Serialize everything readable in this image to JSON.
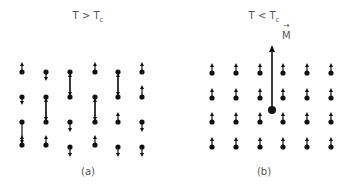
{
  "panel_a": {
    "title_main": "T > T",
    "title_sub": "c",
    "caption": "(a)",
    "description": "disordered spins above Curie temperature",
    "spins": [
      {
        "x": 22,
        "y": 72,
        "dir": "up",
        "len": 10
      },
      {
        "x": 22,
        "y": 97,
        "dir": "down",
        "len": 8
      },
      {
        "x": 22,
        "y": 122,
        "dir": "down",
        "len": 22
      },
      {
        "x": 22,
        "y": 145,
        "dir": "up",
        "len": 10
      },
      {
        "x": 46,
        "y": 72,
        "dir": "down",
        "len": 9
      },
      {
        "x": 46,
        "y": 97,
        "dir": "down",
        "len": 24
      },
      {
        "x": 46,
        "y": 122,
        "dir": "up",
        "len": 24
      },
      {
        "x": 46,
        "y": 145,
        "dir": "up",
        "len": 10
      },
      {
        "x": 70,
        "y": 72,
        "dir": "down",
        "len": 24
      },
      {
        "x": 70,
        "y": 97,
        "dir": "up",
        "len": 24
      },
      {
        "x": 70,
        "y": 122,
        "dir": "down",
        "len": 10
      },
      {
        "x": 70,
        "y": 147,
        "dir": "down",
        "len": 10
      },
      {
        "x": 95,
        "y": 72,
        "dir": "up",
        "len": 10
      },
      {
        "x": 95,
        "y": 97,
        "dir": "down",
        "len": 24
      },
      {
        "x": 95,
        "y": 122,
        "dir": "up",
        "len": 24
      },
      {
        "x": 95,
        "y": 145,
        "dir": "up",
        "len": 10
      },
      {
        "x": 118,
        "y": 72,
        "dir": "down",
        "len": 24
      },
      {
        "x": 118,
        "y": 97,
        "dir": "up",
        "len": 24
      },
      {
        "x": 118,
        "y": 122,
        "dir": "up",
        "len": 10
      },
      {
        "x": 118,
        "y": 147,
        "dir": "down",
        "len": 10
      },
      {
        "x": 142,
        "y": 72,
        "dir": "up",
        "len": 10
      },
      {
        "x": 142,
        "y": 97,
        "dir": "up",
        "len": 12
      },
      {
        "x": 142,
        "y": 122,
        "dir": "down",
        "len": 10
      },
      {
        "x": 142,
        "y": 147,
        "dir": "down",
        "len": 10
      }
    ]
  },
  "panel_b": {
    "title_main": "T < T",
    "title_sub": "c",
    "caption": "(b)",
    "magnetization_label": "M",
    "magnetization_vector": {
      "x": 272,
      "y_base": 110,
      "y_tip": 45
    },
    "description": "aligned spins below Curie temperature",
    "columns_x": [
      212,
      236,
      260,
      283,
      307,
      331
    ],
    "rows_y": [
      73,
      98,
      122,
      147
    ],
    "spin_dir": "up",
    "spin_len": 10
  }
}
